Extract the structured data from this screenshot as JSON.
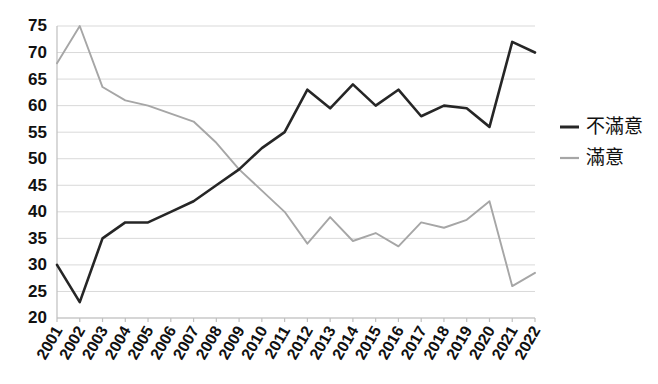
{
  "chart_data": {
    "type": "line",
    "title": "",
    "subtitle": "",
    "xlabel": "",
    "ylabel": "",
    "categories": [
      "2001",
      "2002",
      "2003",
      "2004",
      "2005",
      "2006",
      "2007",
      "2008",
      "2009",
      "2010",
      "2011",
      "2012",
      "2013",
      "2014",
      "2015",
      "2016",
      "2017",
      "2018",
      "2019",
      "2020",
      "2021",
      "2022"
    ],
    "series": [
      {
        "name": "不滿意",
        "color": "#262626",
        "values": [
          30,
          23,
          35,
          38,
          38,
          40,
          42,
          45,
          48,
          52,
          55,
          63,
          59.5,
          64,
          60,
          63,
          58,
          60,
          59.5,
          56,
          72,
          70
        ]
      },
      {
        "name": "滿意",
        "color": "#a6a6a6",
        "values": [
          68,
          75,
          63.5,
          61,
          60,
          58.5,
          57,
          53,
          48,
          44,
          40,
          34,
          39,
          34.5,
          36,
          33.5,
          38,
          37,
          38.5,
          42,
          26,
          28.5
        ]
      }
    ],
    "ylim": [
      20,
      75
    ],
    "yticks": [
      20,
      25,
      30,
      35,
      40,
      45,
      50,
      55,
      60,
      65,
      70,
      75
    ],
    "grid": true,
    "legend_position": "right"
  },
  "legend": {
    "entries": [
      {
        "label": "不滿意",
        "color": "#262626"
      },
      {
        "label": "滿意",
        "color": "#a6a6a6"
      }
    ]
  }
}
